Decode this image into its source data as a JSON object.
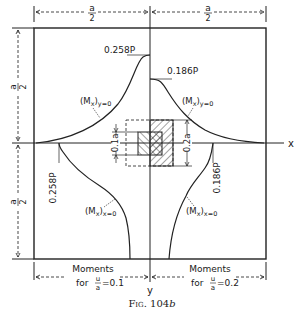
{
  "figure": {
    "caption": "Fig. 104b",
    "caption_fig": "Fig.",
    "caption_num": "104",
    "caption_suffix": "b"
  },
  "dimensions": {
    "top_left": {
      "num": "a",
      "den": "2"
    },
    "top_right": {
      "num": "a",
      "den": "2"
    },
    "left_top": {
      "num": "a",
      "den": "2"
    },
    "left_bottom": {
      "num": "a",
      "den": "2"
    },
    "inner_square": "0.1a",
    "outer_square": "0.2a"
  },
  "axes": {
    "x_label": "x",
    "y_label": "y"
  },
  "curves": {
    "upper_left": {
      "label": "(M",
      "sub_x": "x",
      "cond": "y=0",
      "peak_label": "0.258P"
    },
    "upper_right": {
      "label": "(M",
      "sub_x": "x",
      "cond": "y=0",
      "peak_label": "0.186P"
    },
    "lower_left": {
      "label": "(M",
      "sub_x": "x",
      "cond": "x=0",
      "peak_label": "0.258P"
    },
    "lower_right": {
      "label": "(M",
      "sub_x": "x",
      "cond": "x=0",
      "peak_label": "0.186P"
    }
  },
  "bottom_labels": {
    "left": {
      "line1": "Moments",
      "for": "for",
      "frac_num": "u",
      "frac_den": "a",
      "value": "=0.1"
    },
    "right": {
      "line1": "Moments",
      "for": "for",
      "frac_num": "u",
      "frac_den": "a",
      "value": "=0.2"
    }
  },
  "colors": {
    "ink": "#222222",
    "background": "#ffffff"
  }
}
